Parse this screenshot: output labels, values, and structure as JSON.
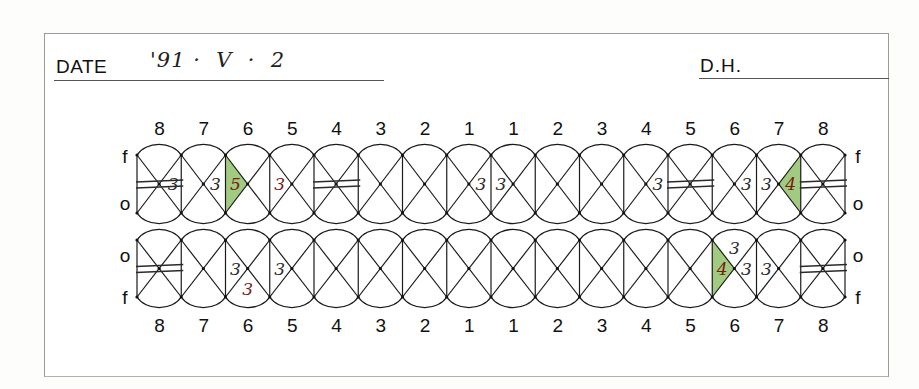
{
  "header": {
    "date_label": "DATE",
    "date_value": "'91 ·  V  ·  2",
    "dh_label": "D.H."
  },
  "colors": {
    "ink": "#111111",
    "pencil_black": "#2a2a2a",
    "red_pen": "#7a1a14",
    "highlight_green": "#8fc26a"
  },
  "chart_data": {
    "type": "table",
    "upper_row": {
      "tooth_numbers": [
        "8",
        "7",
        "6",
        "5",
        "4",
        "3",
        "2",
        "1",
        "1",
        "2",
        "3",
        "4",
        "5",
        "6",
        "7",
        "8"
      ],
      "left_side_labels": {
        "top": "f",
        "bottom": "o"
      },
      "right_side_labels": {
        "top": "f",
        "bottom": "o"
      },
      "marks": [
        {
          "tooth_index": 0,
          "type": "missing",
          "note": "double horizontal strike"
        },
        {
          "tooth_index": 0,
          "type": "value",
          "position": "distal-right",
          "value": "3"
        },
        {
          "tooth_index": 1,
          "type": "value",
          "position": "right",
          "value": "3"
        },
        {
          "tooth_index": 2,
          "type": "value",
          "position": "left",
          "value": "5",
          "highlight": "green",
          "ink": "red"
        },
        {
          "tooth_index": 3,
          "type": "value",
          "position": "left",
          "value": "3",
          "ink": "red"
        },
        {
          "tooth_index": 4,
          "type": "missing",
          "note": "double horizontal strike"
        },
        {
          "tooth_index": 7,
          "type": "value",
          "position": "right",
          "value": "3"
        },
        {
          "tooth_index": 8,
          "type": "value",
          "position": "left",
          "value": "3"
        },
        {
          "tooth_index": 11,
          "type": "value",
          "position": "right",
          "value": "3"
        },
        {
          "tooth_index": 12,
          "type": "missing",
          "note": "double horizontal strike"
        },
        {
          "tooth_index": 13,
          "type": "value",
          "position": "right",
          "value": "3"
        },
        {
          "tooth_index": 14,
          "type": "value",
          "position": "left",
          "value": "3"
        },
        {
          "tooth_index": 14,
          "type": "value",
          "position": "right",
          "value": "4",
          "highlight": "green",
          "ink": "red"
        },
        {
          "tooth_index": 15,
          "type": "missing",
          "note": "double horizontal strike"
        }
      ]
    },
    "lower_row": {
      "tooth_numbers": [
        "8",
        "7",
        "6",
        "5",
        "4",
        "3",
        "2",
        "1",
        "1",
        "2",
        "3",
        "4",
        "5",
        "6",
        "7",
        "8"
      ],
      "left_side_labels": {
        "top": "o",
        "bottom": "f"
      },
      "right_side_labels": {
        "top": "o",
        "bottom": "f"
      },
      "marks": [
        {
          "tooth_index": 0,
          "type": "missing",
          "note": "double horizontal strike"
        },
        {
          "tooth_index": 2,
          "type": "value",
          "position": "left",
          "value": "3"
        },
        {
          "tooth_index": 2,
          "type": "value",
          "position": "bottom",
          "value": "3",
          "ink": "red"
        },
        {
          "tooth_index": 3,
          "type": "value",
          "position": "left",
          "value": "3"
        },
        {
          "tooth_index": 13,
          "type": "value",
          "position": "top",
          "value": "3"
        },
        {
          "tooth_index": 13,
          "type": "value",
          "position": "left",
          "value": "4",
          "highlight": "green",
          "ink": "red"
        },
        {
          "tooth_index": 13,
          "type": "value",
          "position": "right",
          "value": "3"
        },
        {
          "tooth_index": 14,
          "type": "value",
          "position": "left",
          "value": "3"
        },
        {
          "tooth_index": 15,
          "type": "missing",
          "note": "double horizontal strike"
        }
      ]
    }
  }
}
